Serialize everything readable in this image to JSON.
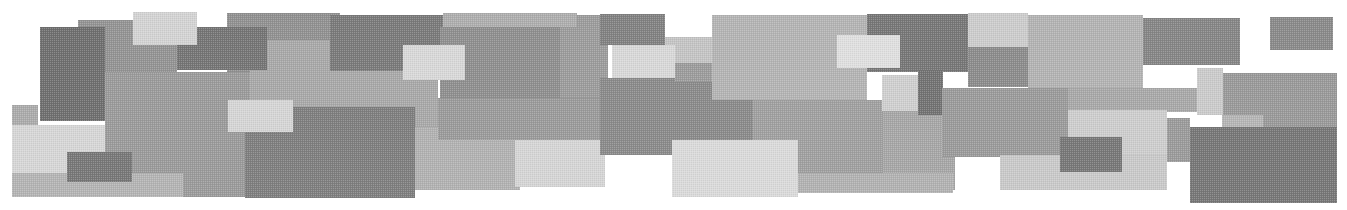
{
  "canvas": {
    "width": 1347,
    "height": 210,
    "background": "#ffffff",
    "texture": "halftone-dither",
    "palette": [
      "#6f6f6f",
      "#737373",
      "#757575",
      "#777777",
      "#787878",
      "#7a7a7a",
      "#7f7f7f",
      "#828282",
      "#868686",
      "#8a8a8a",
      "#8b8b8b",
      "#8c8c8c",
      "#8f8f8f",
      "#919191",
      "#949494",
      "#9a9a9a",
      "#9b9b9b",
      "#9c9c9c",
      "#a0a0a0",
      "#a7a7a7",
      "#a9a9a9",
      "#ababab",
      "#aeaeae",
      "#b2b2b2",
      "#b3b3b3",
      "#b4b4b4",
      "#b5b5b5",
      "#c4c4c4",
      "#c9c9c9",
      "#cbcbcb",
      "#cccccc",
      "#cdcdcd",
      "#cfcfcf",
      "#d3d3d3",
      "#d5d5d5",
      "#d6d6d6",
      "#d8d8d8",
      "#dadada",
      "#dfdfdf"
    ],
    "rectangles": [
      {
        "x": 78,
        "y": 20,
        "w": 99,
        "h": 52,
        "color": "#949494"
      },
      {
        "x": 40,
        "y": 27,
        "w": 65,
        "h": 94,
        "color": "#6f6f6f"
      },
      {
        "x": 227,
        "y": 13,
        "w": 113,
        "h": 59,
        "color": "#919191"
      },
      {
        "x": 250,
        "y": 40,
        "w": 188,
        "h": 87,
        "color": "#a9a9a9"
      },
      {
        "x": 177,
        "y": 27,
        "w": 90,
        "h": 43,
        "color": "#757575"
      },
      {
        "x": 133,
        "y": 12,
        "w": 64,
        "h": 33,
        "color": "#d3d3d3"
      },
      {
        "x": 330,
        "y": 15,
        "w": 113,
        "h": 56,
        "color": "#7a7a7a"
      },
      {
        "x": 105,
        "y": 72,
        "w": 145,
        "h": 125,
        "color": "#9b9b9b"
      },
      {
        "x": 245,
        "y": 107,
        "w": 170,
        "h": 91,
        "color": "#7f7f7f"
      },
      {
        "x": 228,
        "y": 100,
        "w": 65,
        "h": 32,
        "color": "#d5d5d5"
      },
      {
        "x": 12,
        "y": 105,
        "w": 26,
        "h": 23,
        "color": "#ababab"
      },
      {
        "x": 12,
        "y": 125,
        "w": 93,
        "h": 48,
        "color": "#d6d6d6"
      },
      {
        "x": 12,
        "y": 173,
        "w": 171,
        "h": 24,
        "color": "#b4b4b4"
      },
      {
        "x": 67,
        "y": 152,
        "w": 65,
        "h": 30,
        "color": "#787878"
      },
      {
        "x": 560,
        "y": 15,
        "w": 48,
        "h": 85,
        "color": "#9c9c9c"
      },
      {
        "x": 440,
        "y": 27,
        "w": 120,
        "h": 71,
        "color": "#8f8f8f"
      },
      {
        "x": 443,
        "y": 13,
        "w": 134,
        "h": 14,
        "color": "#aeaeae"
      },
      {
        "x": 403,
        "y": 45,
        "w": 62,
        "h": 35,
        "color": "#d8d8d8"
      },
      {
        "x": 415,
        "y": 127,
        "w": 105,
        "h": 63,
        "color": "#b2b2b2"
      },
      {
        "x": 515,
        "y": 138,
        "w": 90,
        "h": 49,
        "color": "#d5d5d5"
      },
      {
        "x": 438,
        "y": 98,
        "w": 167,
        "h": 42,
        "color": "#9b9b9b"
      },
      {
        "x": 600,
        "y": 14,
        "w": 65,
        "h": 31,
        "color": "#828282"
      },
      {
        "x": 665,
        "y": 37,
        "w": 48,
        "h": 26,
        "color": "#c4c4c4"
      },
      {
        "x": 612,
        "y": 45,
        "w": 63,
        "h": 33,
        "color": "#d8d8d8"
      },
      {
        "x": 600,
        "y": 78,
        "w": 155,
        "h": 77,
        "color": "#8b8b8b"
      },
      {
        "x": 675,
        "y": 63,
        "w": 38,
        "h": 19,
        "color": "#9c9c9c"
      },
      {
        "x": 712,
        "y": 15,
        "w": 155,
        "h": 85,
        "color": "#b4b4b4"
      },
      {
        "x": 867,
        "y": 14,
        "w": 101,
        "h": 58,
        "color": "#777777"
      },
      {
        "x": 837,
        "y": 35,
        "w": 63,
        "h": 33,
        "color": "#dfdfdf"
      },
      {
        "x": 753,
        "y": 100,
        "w": 130,
        "h": 75,
        "color": "#a0a0a0"
      },
      {
        "x": 672,
        "y": 140,
        "w": 126,
        "h": 57,
        "color": "#dadada"
      },
      {
        "x": 883,
        "y": 105,
        "w": 72,
        "h": 85,
        "color": "#a7a7a7"
      },
      {
        "x": 798,
        "y": 173,
        "w": 155,
        "h": 20,
        "color": "#b2b2b2"
      },
      {
        "x": 882,
        "y": 75,
        "w": 38,
        "h": 36,
        "color": "#cfcfcf"
      },
      {
        "x": 918,
        "y": 70,
        "w": 25,
        "h": 45,
        "color": "#737373"
      },
      {
        "x": 968,
        "y": 13,
        "w": 60,
        "h": 34,
        "color": "#cccccc"
      },
      {
        "x": 968,
        "y": 47,
        "w": 60,
        "h": 40,
        "color": "#8c8c8c"
      },
      {
        "x": 942,
        "y": 88,
        "w": 128,
        "h": 69,
        "color": "#9b9b9b"
      },
      {
        "x": 1028,
        "y": 15,
        "w": 115,
        "h": 73,
        "color": "#b3b3b3"
      },
      {
        "x": 1068,
        "y": 88,
        "w": 129,
        "h": 24,
        "color": "#a9a9a9"
      },
      {
        "x": 1143,
        "y": 18,
        "w": 97,
        "h": 47,
        "color": "#868686"
      },
      {
        "x": 1197,
        "y": 68,
        "w": 26,
        "h": 47,
        "color": "#cbcbcb"
      },
      {
        "x": 1223,
        "y": 73,
        "w": 114,
        "h": 54,
        "color": "#9a9a9a"
      },
      {
        "x": 1270,
        "y": 17,
        "w": 63,
        "h": 33,
        "color": "#8a8a8a"
      },
      {
        "x": 1068,
        "y": 110,
        "w": 99,
        "h": 55,
        "color": "#cdcdcd"
      },
      {
        "x": 1000,
        "y": 155,
        "w": 167,
        "h": 35,
        "color": "#c9c9c9"
      },
      {
        "x": 1060,
        "y": 137,
        "w": 62,
        "h": 35,
        "color": "#787878"
      },
      {
        "x": 1167,
        "y": 118,
        "w": 23,
        "h": 44,
        "color": "#9b9b9b"
      },
      {
        "x": 1222,
        "y": 115,
        "w": 41,
        "h": 12,
        "color": "#b5b5b5"
      },
      {
        "x": 1190,
        "y": 127,
        "w": 147,
        "h": 76,
        "color": "#777777"
      }
    ]
  }
}
